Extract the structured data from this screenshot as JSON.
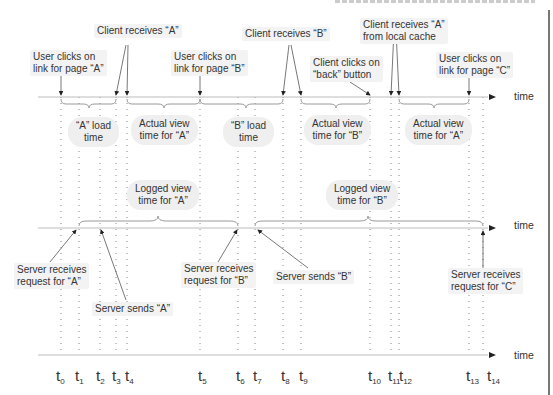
{
  "diagram": {
    "type": "timeline",
    "axes": [
      {
        "id": "client",
        "label": "time"
      },
      {
        "id": "server",
        "label": "time"
      },
      {
        "id": "reference",
        "label": "time"
      }
    ],
    "ticks": [
      {
        "base": "t",
        "sub": "0"
      },
      {
        "base": "t",
        "sub": "1"
      },
      {
        "base": "t",
        "sub": "2"
      },
      {
        "base": "t",
        "sub": "3"
      },
      {
        "base": "t",
        "sub": "4"
      },
      {
        "base": "t",
        "sub": "5"
      },
      {
        "base": "t",
        "sub": "6"
      },
      {
        "base": "t",
        "sub": "7"
      },
      {
        "base": "t",
        "sub": "8"
      },
      {
        "base": "t",
        "sub": "9"
      },
      {
        "base": "t",
        "sub": "10"
      },
      {
        "base": "t",
        "sub": "11"
      },
      {
        "base": "t",
        "sub": "12"
      },
      {
        "base": "t",
        "sub": "13"
      },
      {
        "base": "t",
        "sub": "14"
      }
    ],
    "client_events": {
      "user_clicks_a": [
        "User clicks on",
        "link for page “A”"
      ],
      "client_receives_a": "Client receives “A”",
      "user_clicks_b": [
        "User clicks on",
        "link for page “B”"
      ],
      "client_receives_b": "Client receives “B”",
      "client_clicks_back": [
        "Client clicks on",
        "“back” button"
      ],
      "client_receives_a_cache": [
        "Client receives “A”",
        "from local cache"
      ],
      "user_clicks_c": [
        "User clicks on",
        "link for page “C”"
      ]
    },
    "client_intervals": {
      "a_load": [
        "“A” load",
        "time"
      ],
      "actual_view_a": [
        "Actual view",
        "time for “A”"
      ],
      "b_load": [
        "“B” load",
        "time"
      ],
      "actual_view_b": [
        "Actual view",
        "time for “B”"
      ],
      "actual_view_a2": [
        "Actual view",
        "time for “A”"
      ]
    },
    "server_intervals": {
      "logged_view_a": [
        "Logged view",
        "time for “A”"
      ],
      "logged_view_b": [
        "Logged view",
        "time for “B”"
      ]
    },
    "server_events": {
      "server_receives_a": [
        "Server receives",
        "request for “A”"
      ],
      "server_sends_a": "Server sends “A”",
      "server_receives_b": [
        "Server receives",
        "request for “B”"
      ],
      "server_sends_b": "Server sends “B”",
      "server_receives_c": [
        "Server receives",
        "request for “C”"
      ]
    },
    "colors": {
      "axis": "#bdbdbd",
      "brace": "#9a9a9a",
      "arrow": "#222222",
      "label_bg": "#f3f3f3",
      "text": "#333333"
    }
  }
}
